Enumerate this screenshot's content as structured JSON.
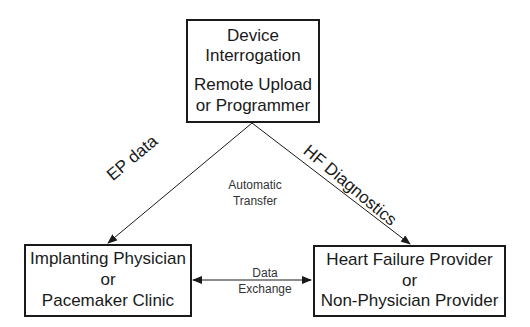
{
  "diagram": {
    "top_box": {
      "line1": "Device",
      "line2": "Interrogation",
      "line3": "Remote Upload",
      "line4": "or Programmer"
    },
    "left_box": {
      "line1": "Implanting Physician",
      "line2": "or",
      "line3": "Pacemaker Clinic"
    },
    "right_box": {
      "line1": "Heart Failure Provider",
      "line2": "or",
      "line3": "Non-Physician Provider"
    },
    "edges": {
      "left_arrow_label": "EP data",
      "right_arrow_label": "HF Diagnostics",
      "center_label_line1": "Automatic",
      "center_label_line2": "Transfer",
      "exchange_label_line1": "Data",
      "exchange_label_line2": "Exchange"
    },
    "colors": {
      "stroke": "#1a1a1a",
      "background": "#ffffff"
    }
  }
}
